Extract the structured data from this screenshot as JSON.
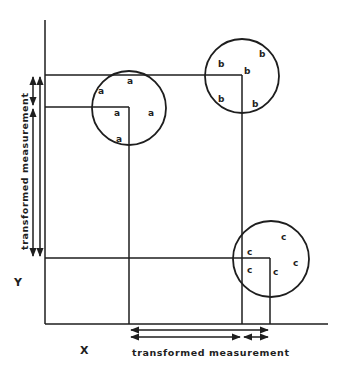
{
  "diagram": {
    "axis_labels": {
      "x": "X",
      "y": "Y"
    },
    "measurement_label_x": "transformed measurement",
    "measurement_label_y": "transformed measurement",
    "clusters": [
      {
        "name": "a",
        "points": [
          "a",
          "a",
          "a",
          "a",
          "a"
        ]
      },
      {
        "name": "b",
        "points": [
          "b",
          "b",
          "b",
          "b",
          "b"
        ]
      },
      {
        "name": "c",
        "points": [
          "c",
          "c",
          "c",
          "c",
          "c"
        ]
      }
    ],
    "colors": {
      "ink": "#1e1e1e",
      "background": "#ffffff"
    }
  }
}
